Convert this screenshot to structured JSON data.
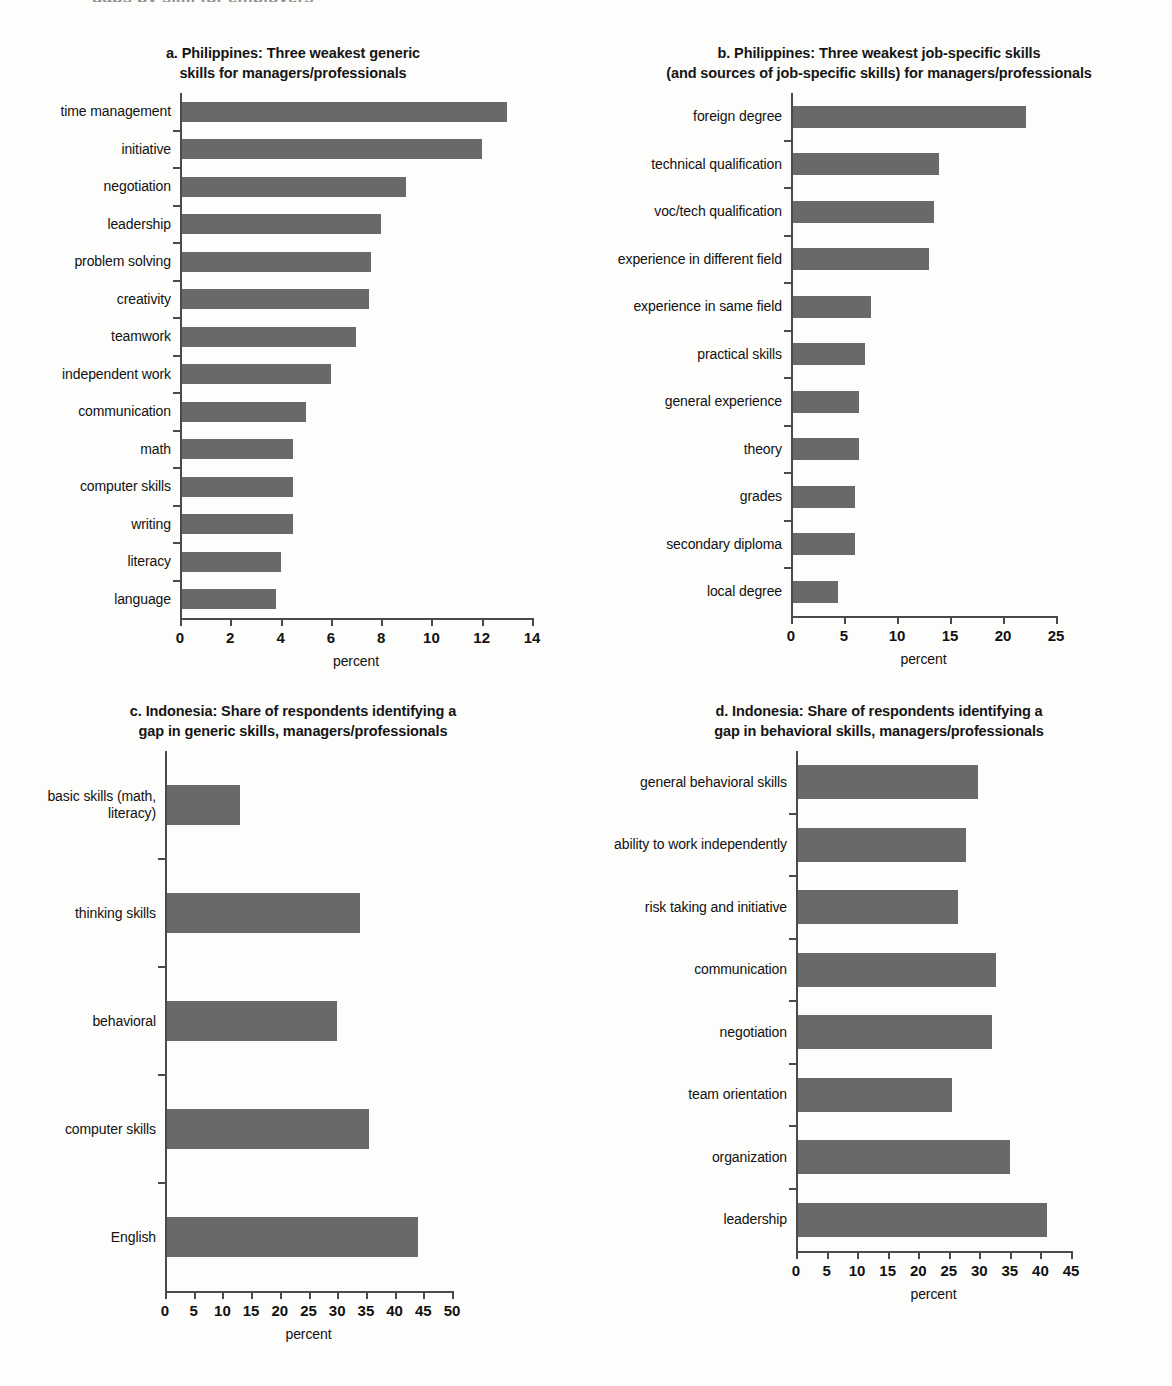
{
  "figure": {
    "cut_header_text": "gaps by skill for employers"
  },
  "panels": [
    {
      "id": "a",
      "title": "a. Philippines: Three weakest generic\nskills for managers/professionals",
      "axis_title": "percent"
    },
    {
      "id": "b",
      "title": "b. Philippines: Three weakest job-specific skills\n(and sources of job-specific skills) for managers/professionals",
      "axis_title": "percent"
    },
    {
      "id": "c",
      "title": "c. Indonesia: Share of respondents identifying a\ngap in generic skills, managers/professionals",
      "axis_title": "percent"
    },
    {
      "id": "d",
      "title": "d. Indonesia: Share of respondents identifying a\ngap in behavioral skills, managers/professionals",
      "axis_title": "percent"
    }
  ],
  "chart_data": [
    {
      "panel": "a",
      "type": "bar",
      "orientation": "horizontal",
      "title": "a. Philippines: Three weakest generic skills for managers/professionals",
      "xlabel": "percent",
      "ylabel": "",
      "xlim": [
        0,
        14
      ],
      "xticks": [
        0,
        2,
        4,
        6,
        8,
        10,
        12,
        14
      ],
      "grid": false,
      "legend": "none",
      "categories": [
        "time management",
        "initiative",
        "negotiation",
        "leadership",
        "problem solving",
        "creativity",
        "teamwork",
        "independent work",
        "communication",
        "math",
        "computer skills",
        "writing",
        "literacy",
        "language"
      ],
      "values": [
        13.0,
        12.0,
        9.0,
        8.0,
        7.6,
        7.5,
        7.0,
        6.0,
        5.0,
        4.5,
        4.5,
        4.5,
        4.0,
        3.8
      ]
    },
    {
      "panel": "b",
      "type": "bar",
      "orientation": "horizontal",
      "title": "b. Philippines: Three weakest job-specific skills (and sources of job-specific skills) for managers/professionals",
      "xlabel": "percent",
      "ylabel": "",
      "xlim": [
        0,
        25
      ],
      "xticks": [
        0,
        5,
        10,
        15,
        20,
        25
      ],
      "grid": false,
      "legend": "none",
      "categories": [
        "foreign degree",
        "technical qualification",
        "voc/tech qualification",
        "experience in different field",
        "experience in same field",
        "practical skills",
        "general experience",
        "theory",
        "grades",
        "secondary diploma",
        "local degree"
      ],
      "values": [
        22.2,
        14.0,
        13.5,
        13.0,
        7.5,
        7.0,
        6.4,
        6.4,
        6.0,
        6.0,
        4.4
      ]
    },
    {
      "panel": "c",
      "type": "bar",
      "orientation": "horizontal",
      "title": "c. Indonesia: Share of respondents identifying a gap in generic skills, managers/professionals",
      "xlabel": "percent",
      "ylabel": "",
      "xlim": [
        0,
        50
      ],
      "xticks": [
        0,
        5,
        10,
        15,
        20,
        25,
        30,
        35,
        40,
        45,
        50
      ],
      "grid": false,
      "legend": "none",
      "categories": [
        "basic skills (math,\nliteracy)",
        "thinking skills",
        "behavioral",
        "computer skills",
        "English"
      ],
      "values": [
        13.0,
        34.0,
        30.0,
        35.5,
        44.0
      ]
    },
    {
      "panel": "d",
      "type": "bar",
      "orientation": "horizontal",
      "title": "d. Indonesia: Share of respondents identifying a gap in behavioral skills, managers/professionals",
      "xlabel": "percent",
      "ylabel": "",
      "xlim": [
        0,
        45
      ],
      "xticks": [
        0,
        5,
        10,
        15,
        20,
        25,
        30,
        35,
        40,
        45
      ],
      "grid": false,
      "legend": "none",
      "categories": [
        "general behavioral skills",
        "ability to work independently",
        "risk taking and initiative",
        "communication",
        "negotiation",
        "team orientation",
        "organization",
        "leadership"
      ],
      "values": [
        29.8,
        27.8,
        26.5,
        32.8,
        32.0,
        25.5,
        35.0,
        41.0
      ]
    }
  ],
  "style": {
    "bar_color": "#696969",
    "axis_color": "#4a4a4a",
    "text_color": "#111111",
    "background": "#fdfdfc"
  }
}
